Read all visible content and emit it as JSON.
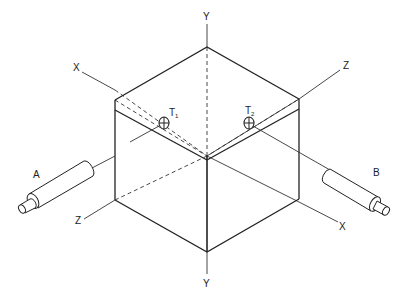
{
  "figure": {
    "type": "isometric cube with thermocouples and heaters",
    "axes": {
      "y_top": "Y",
      "y_bottom": "Y",
      "x_left": "X",
      "x_right": "X",
      "z_right": "Z",
      "z_left": "Z"
    },
    "sensors": {
      "t1": {
        "label": "T",
        "subscript": "1"
      },
      "t2": {
        "label": "T",
        "subscript": "2"
      }
    },
    "devices": {
      "a": {
        "label": "A"
      },
      "b": {
        "label": "B"
      }
    },
    "colors": {
      "line": "#222222",
      "background": "#ffffff"
    }
  }
}
